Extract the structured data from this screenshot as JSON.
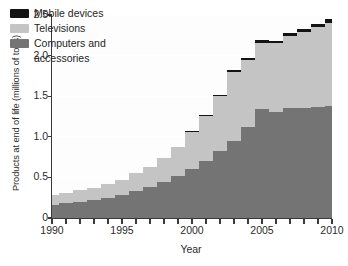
{
  "chart_data": {
    "type": "area",
    "stacked": true,
    "title": "",
    "xlabel": "Year",
    "ylabel": "Products at end of life (millions of tons)",
    "xlim": [
      1990,
      2010
    ],
    "ylim": [
      0,
      2.5
    ],
    "grid": true,
    "grid_color": "#ffffff",
    "legend_position": "top-left",
    "x": [
      1990,
      1991,
      1992,
      1993,
      1994,
      1995,
      1996,
      1997,
      1998,
      1999,
      2000,
      2001,
      2002,
      2003,
      2004,
      2005,
      2006,
      2007,
      2008,
      2009,
      2010
    ],
    "xtick_labels": [
      "1990",
      "1995",
      "2000",
      "2005",
      "2010"
    ],
    "xtick_values": [
      1990,
      1995,
      2000,
      2005,
      2010
    ],
    "ytick_labels": [
      "0",
      "0.5",
      "1.0",
      "1.5",
      "2.0",
      "2.5"
    ],
    "ytick_values": [
      0,
      0.5,
      1.0,
      1.5,
      2.0,
      2.5
    ],
    "series": [
      {
        "name": "Computers and accessories",
        "color": "#747474",
        "values": [
          0.16,
          0.18,
          0.2,
          0.22,
          0.25,
          0.28,
          0.33,
          0.38,
          0.44,
          0.52,
          0.6,
          0.7,
          0.82,
          0.95,
          1.12,
          1.34,
          1.31,
          1.35,
          1.36,
          1.37,
          1.38
        ]
      },
      {
        "name": "Televisions",
        "color": "#c4c4c4",
        "values": [
          0.12,
          0.13,
          0.14,
          0.15,
          0.17,
          0.19,
          0.22,
          0.25,
          0.3,
          0.36,
          0.46,
          0.56,
          0.68,
          0.85,
          0.82,
          0.82,
          0.84,
          0.89,
          0.93,
          0.98,
          1.02
        ]
      },
      {
        "name": "Mobile devices",
        "color": "#141414",
        "values": [
          0.0,
          0.0,
          0.0,
          0.0,
          0.0,
          0.0,
          0.0,
          0.0,
          0.0,
          0.0,
          0.01,
          0.01,
          0.02,
          0.02,
          0.03,
          0.03,
          0.03,
          0.04,
          0.04,
          0.04,
          0.05
        ]
      }
    ],
    "totals": [
      0.28,
      0.31,
      0.34,
      0.37,
      0.42,
      0.47,
      0.55,
      0.63,
      0.74,
      0.88,
      1.07,
      1.27,
      1.52,
      1.82,
      1.97,
      2.19,
      2.18,
      2.28,
      2.33,
      2.39,
      2.45
    ]
  },
  "legend": {
    "items": [
      {
        "label": "Mobile devices",
        "label2": "",
        "color": "#141414"
      },
      {
        "label": "Televisions",
        "label2": "",
        "color": "#c4c4c4"
      },
      {
        "label": "Computers and",
        "label2": "accessories",
        "color": "#747474"
      }
    ]
  },
  "axis": {
    "line_color": "#3a3a3a"
  }
}
